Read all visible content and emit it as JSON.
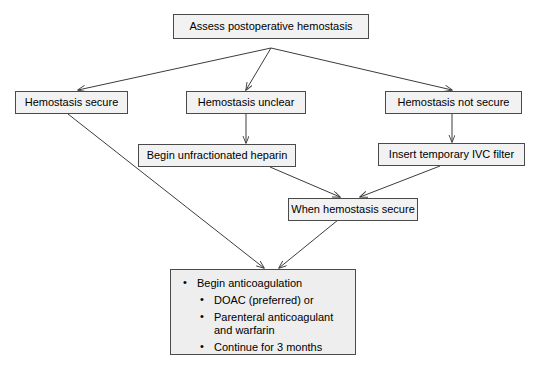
{
  "diagram": {
    "type": "flowchart",
    "background_color": "#ffffff",
    "node_fill_color": "#f2f2f2",
    "node_border_color": "#4a4a4a",
    "edge_color": "#3c3c3c",
    "text_color": "#000000"
  },
  "nodes": {
    "root": {
      "label": "Assess postoperative hemostasis"
    },
    "secure": {
      "label": "Hemostasis secure"
    },
    "unclear": {
      "label": "Hemostasis unclear"
    },
    "not_secure": {
      "label": "Hemostasis not secure"
    },
    "heparin": {
      "label": "Begin unfractionated heparin"
    },
    "ivc_filter": {
      "label": "Insert temporary IVC filter"
    },
    "when_secure": {
      "label": "When hemostasis secure"
    },
    "anticoagulation": {
      "main_bullet": "Begin anticoagulation",
      "sub_bullets": [
        "DOAC (preferred) or",
        "Parenteral anticoagulant and warfarin",
        "Continue for 3 months"
      ]
    }
  },
  "edges": [
    {
      "from": "root",
      "to": "secure"
    },
    {
      "from": "root",
      "to": "unclear"
    },
    {
      "from": "root",
      "to": "not_secure"
    },
    {
      "from": "unclear",
      "to": "heparin"
    },
    {
      "from": "not_secure",
      "to": "ivc_filter"
    },
    {
      "from": "heparin",
      "to": "when_secure"
    },
    {
      "from": "ivc_filter",
      "to": "when_secure"
    },
    {
      "from": "secure",
      "to": "anticoagulation"
    },
    {
      "from": "when_secure",
      "to": "anticoagulation"
    }
  ]
}
